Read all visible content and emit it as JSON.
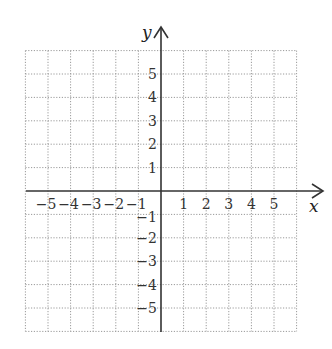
{
  "chart_data": {
    "type": "scatter",
    "title": "",
    "xlabel": "x",
    "ylabel": "y",
    "xlim": [
      -6,
      6
    ],
    "ylim": [
      -6,
      6
    ],
    "grid": true,
    "grid_style": "dotted",
    "x_ticks": [
      -5,
      -4,
      -3,
      -2,
      -1,
      1,
      2,
      3,
      4,
      5
    ],
    "y_ticks": [
      5,
      4,
      3,
      2,
      1,
      -1,
      -2,
      -3,
      -4,
      -5
    ],
    "x_tick_labels": [
      "−5",
      "−4",
      "−3",
      "−2",
      "−1",
      "1",
      "2",
      "3",
      "4",
      "5"
    ],
    "y_tick_labels": [
      "5",
      "4",
      "3",
      "2",
      "1",
      "−1",
      "−2",
      "−3",
      "−4",
      "−5"
    ],
    "series": []
  },
  "colors": {
    "axis": "#333333",
    "grid": "#9a9a9a",
    "text": "#333333"
  }
}
